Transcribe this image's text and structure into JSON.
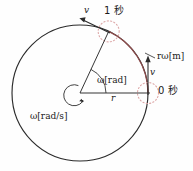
{
  "figure": {
    "type": "diagram",
    "geometry": {
      "center_x": 80,
      "center_y": 93,
      "radius": 68,
      "start_angle_deg": 0,
      "end_angle_deg": 65
    },
    "colors": {
      "circle": "#2b2b2b",
      "arc": "#8c4a4a",
      "marker": "#d9a3a3",
      "text": "#1a1a1a"
    }
  },
  "labels": {
    "v_top": "v",
    "t1": "1 秒",
    "arc_length": "rω[m]",
    "v_right": "v",
    "t0": "0 秒",
    "angle": "ω[rad]",
    "radius": "r",
    "angular_velocity": "ω[rad/s]"
  },
  "footer": {
    "caption": ""
  }
}
